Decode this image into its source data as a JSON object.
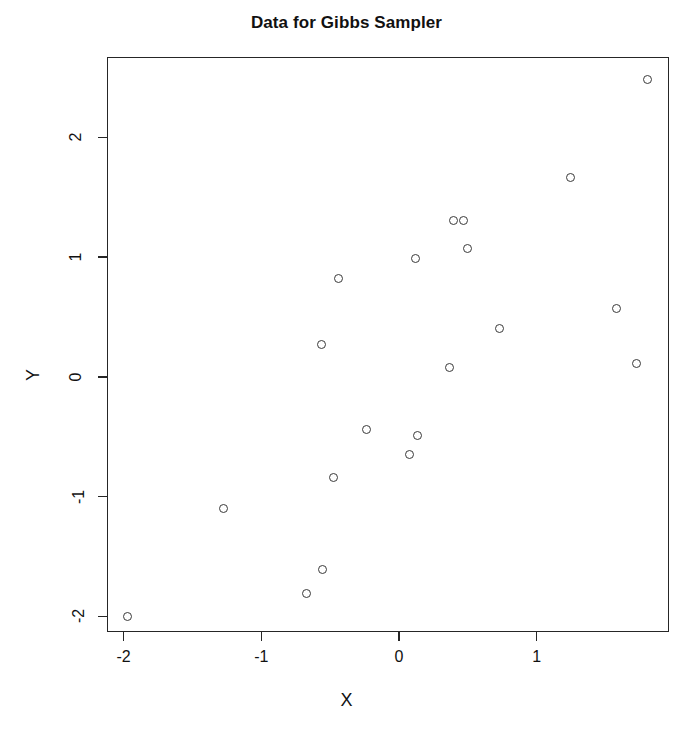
{
  "chart_data": {
    "type": "scatter",
    "title": "Data for Gibbs Sampler",
    "xlabel": "X",
    "ylabel": "Y",
    "grid": false,
    "legend": null,
    "marker": "open-circle",
    "marker_color": "#3a3a3a",
    "background_color": "#ffffff",
    "frame_color": "#262626",
    "xlim": [
      -2.12,
      1.96
    ],
    "ylim": [
      -2.13,
      2.67
    ],
    "xticks": [
      -2,
      -1,
      0,
      1
    ],
    "xticklabels": [
      "-2",
      "-1",
      "0",
      "1"
    ],
    "yticks": [
      -2,
      -1,
      0,
      1,
      2
    ],
    "yticklabels": [
      "-2",
      "-1",
      "0",
      "1",
      "2"
    ],
    "n_points": 20,
    "x": [
      -1.98,
      -1.28,
      -0.68,
      -0.56,
      -0.48,
      -0.57,
      -0.45,
      -0.24,
      0.07,
      0.13,
      0.11,
      0.36,
      0.39,
      0.46,
      0.49,
      0.72,
      1.24,
      1.57,
      1.72,
      1.8
    ],
    "y": [
      -1.99,
      -1.09,
      -1.8,
      -1.6,
      -0.83,
      0.28,
      0.83,
      -0.43,
      -0.64,
      -0.48,
      1.0,
      0.09,
      1.31,
      1.31,
      1.08,
      0.41,
      1.67,
      0.58,
      0.12,
      2.49
    ],
    "points": [
      {
        "x": -1.98,
        "y": -1.99
      },
      {
        "x": -1.28,
        "y": -1.09
      },
      {
        "x": -0.68,
        "y": -1.8
      },
      {
        "x": -0.56,
        "y": -1.6
      },
      {
        "x": -0.48,
        "y": -0.83
      },
      {
        "x": -0.57,
        "y": 0.28
      },
      {
        "x": -0.45,
        "y": 0.83
      },
      {
        "x": -0.24,
        "y": -0.43
      },
      {
        "x": 0.07,
        "y": -0.64
      },
      {
        "x": 0.13,
        "y": -0.48
      },
      {
        "x": 0.11,
        "y": 1.0
      },
      {
        "x": 0.36,
        "y": 0.09
      },
      {
        "x": 0.39,
        "y": 1.31
      },
      {
        "x": 0.46,
        "y": 1.31
      },
      {
        "x": 0.49,
        "y": 1.08
      },
      {
        "x": 0.72,
        "y": 0.41
      },
      {
        "x": 1.24,
        "y": 1.67
      },
      {
        "x": 1.57,
        "y": 0.58
      },
      {
        "x": 1.72,
        "y": 0.12
      },
      {
        "x": 1.8,
        "y": 2.49
      }
    ]
  }
}
